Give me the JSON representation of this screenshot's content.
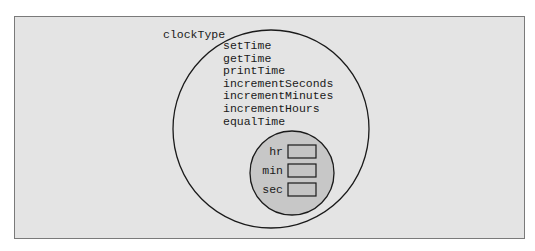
{
  "diagram": {
    "class_name": "clockType",
    "member_functions": [
      "setTime",
      "getTime",
      "printTime",
      "incrementSeconds",
      "incrementMinutes",
      "incrementHours",
      "equalTime"
    ],
    "member_variables": [
      "hr",
      "min",
      "sec"
    ],
    "colors": {
      "background": "#e4e4e4",
      "outer_fill": "#e4e4e4",
      "inner_fill": "#c7c7c7",
      "box_fill": "#c4c4c4",
      "stroke": "#1a1a1a"
    }
  }
}
